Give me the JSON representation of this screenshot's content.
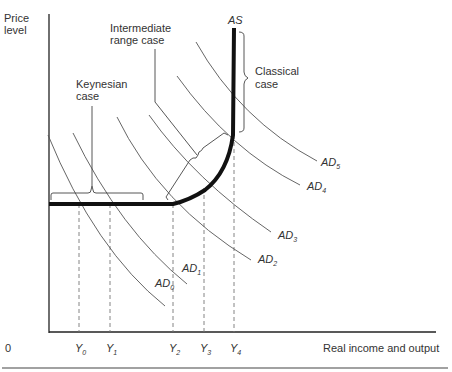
{
  "figure": {
    "y_axis_label_line1": "Price",
    "y_axis_label_line2": "level",
    "x_axis_label": "Real income and output",
    "origin_label": "0",
    "supply_curve_label": "AS",
    "annotations": {
      "keynesian_line1": "Keynesian",
      "keynesian_line2": "case",
      "intermediate_line1": "Intermediate",
      "intermediate_line2": "range case",
      "classical_line1": "Classical",
      "classical_line2": "case"
    },
    "demand_curves": [
      {
        "name": "AD",
        "sub": "0"
      },
      {
        "name": "AD",
        "sub": "1"
      },
      {
        "name": "AD",
        "sub": "2"
      },
      {
        "name": "AD",
        "sub": "3"
      },
      {
        "name": "AD",
        "sub": "4"
      },
      {
        "name": "AD",
        "sub": "5"
      }
    ],
    "x_ticks": [
      {
        "name": "Y",
        "sub": "0"
      },
      {
        "name": "Y",
        "sub": "1"
      },
      {
        "name": "Y",
        "sub": "2"
      },
      {
        "name": "Y",
        "sub": "3"
      },
      {
        "name": "Y",
        "sub": "4"
      }
    ],
    "colors": {
      "as_curve": "#111111",
      "ad_curves": "#555555",
      "axes": "#222222",
      "guides": "#777777"
    }
  }
}
